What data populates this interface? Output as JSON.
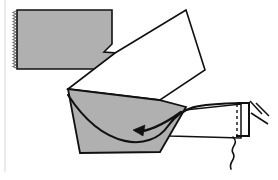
{
  "figure": {
    "canvas": {
      "width": 278,
      "height": 180,
      "background": "#ffffff"
    },
    "palette": {
      "shape_fill_gray": "#b0b0b0",
      "shape_fill_white": "#ffffff",
      "outline": "#111111",
      "margin_rule": "#d8d8d8",
      "serration": "#6e6e6e"
    },
    "parts": [
      {
        "id": "workpiece",
        "name": "workpiece-bar",
        "label": "Workpiece bar (gray, notched)",
        "fill": "#b0b0b0",
        "stroke": "#111111",
        "stroke_width": 1.6,
        "points": "17,10 112,10 112,44 104,52 117,53 130,69 17,69"
      },
      {
        "id": "chip",
        "name": "chip-quadrilateral",
        "label": "Shear-formed chip (white)",
        "fill": "#ffffff",
        "stroke": "#111111",
        "stroke_width": 1.6,
        "points": "115,53 186,10 205,70 160,100 68,89"
      },
      {
        "id": "tool-body",
        "name": "cutting-tool-body",
        "label": "Cutting tool body (gray)",
        "fill": "#b0b0b0",
        "stroke": "#111111",
        "stroke_width": 1.8,
        "points": "68,89 159,100 186,107 160,152 80,153"
      },
      {
        "id": "tool-holder",
        "name": "tool-holder-shank",
        "label": "Tool holder shank (white)",
        "fill": "#ffffff",
        "stroke": "#111111",
        "stroke_width": 1.6,
        "points": "166,112 241,104 241,138 170,136"
      }
    ],
    "curves": [
      {
        "id": "rake-face",
        "name": "rake-face-curve",
        "label": "Curved rake / shear face",
        "stroke": "#111111",
        "stroke_width": 2.0,
        "path": "M 68,95 C 104,150 150,152 168,126 C 182,106 196,104 243,103"
      },
      {
        "id": "squiggle",
        "name": "break-squiggle-line",
        "label": "Break / continuation squiggle",
        "stroke": "#111111",
        "stroke_width": 1.6,
        "path": "M 233,137 C 239,144 230,147 233,153 C 236,159 229,160 231,168"
      }
    ],
    "arrow": {
      "id": "chip-flow-arrow",
      "name": "chip-flow-arrow",
      "label": "Chip flow direction arrow",
      "stroke": "#111111",
      "stroke_width": 2.2,
      "path": "M 181,112 C 163,125 145,133 136,131",
      "head_points": "133,130 144,126 143,136"
    },
    "clamp": {
      "id": "tool-clamp",
      "name": "tool-clamp-bracket",
      "label": "Clamp bracket with hatch lines",
      "stroke": "#111111",
      "stroke_width": 1.8,
      "bracket_path": "M 237,103 L 248,103 L 248,135 L 236,135",
      "dashed_path": "M 237,104 L 237,136",
      "dash_pattern": "3,3",
      "hatch_lines": [
        {
          "x1": 250,
          "y1": 102,
          "x2": 262,
          "y2": 115
        },
        {
          "x1": 255,
          "y1": 104,
          "x2": 268,
          "y2": 117
        },
        {
          "x1": 252,
          "y1": 112,
          "x2": 268,
          "y2": 123
        }
      ]
    },
    "serration": {
      "id": "workpiece-serration",
      "name": "workpiece-serrated-edge",
      "label": "Serrated cut edge of workpiece",
      "x": 16,
      "y_start": 11,
      "y_end": 68,
      "tooth_count": 19,
      "tooth_depth": 3,
      "stroke": "#6e6e6e"
    },
    "margin_rule": {
      "id": "left-margin-rule",
      "name": "left-margin-rule",
      "label": "Faint left page margin rule",
      "x": 5,
      "y1": 0,
      "y2": 172,
      "stroke": "#d8d8d8",
      "stroke_width": 1
    }
  }
}
